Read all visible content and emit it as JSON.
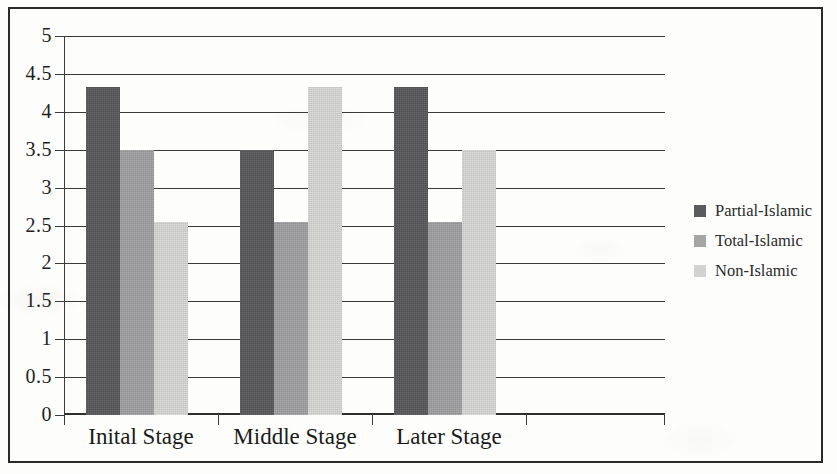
{
  "chart_data": {
    "type": "bar",
    "title": "",
    "subtitle": "",
    "xlabel": "",
    "ylabel": "",
    "categories": [
      "Inital Stage",
      "Middle Stage",
      "Later Stage"
    ],
    "series": [
      {
        "name": "Partial-Islamic",
        "color": "#575759",
        "values": [
          4.33,
          3.5,
          4.33
        ]
      },
      {
        "name": "Total-Islamic",
        "color": "#a0a0a2",
        "values": [
          3.5,
          2.55,
          2.55
        ]
      },
      {
        "name": "Non-Islamic",
        "color": "#d6d6d4",
        "values": [
          2.55,
          4.33,
          3.5
        ]
      }
    ],
    "ylim": [
      0,
      5
    ],
    "ytick_labels": [
      "5",
      "4.5",
      "4",
      "3.5",
      "3",
      "2.5",
      "2",
      "1.5",
      "1",
      "0.5",
      "0"
    ],
    "ytick_values": [
      5,
      4.5,
      4,
      3.5,
      3,
      2.5,
      2,
      1.5,
      1,
      0.5,
      0
    ],
    "grid": true,
    "grid_axis": "y",
    "legend_position": "right",
    "legend_entries": [
      "Partial-Islamic",
      "Total-Islamic",
      "Non-Islamic"
    ]
  },
  "figure": {
    "border_color": "#2a2a2a",
    "background_color": "#fdfdfb",
    "axis_color": "#3b3b3b"
  }
}
